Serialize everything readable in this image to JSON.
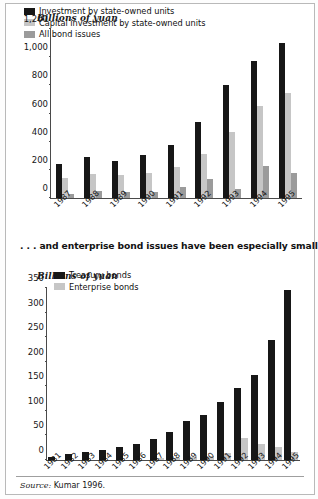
{
  "figure": {
    "mid_caption": ". . . and enterprise bond issues have been especially small",
    "source_prefix": "Source:",
    "source_text": " Kumar 1996."
  },
  "chart_data": [
    {
      "id": "top",
      "type": "bar",
      "title": "",
      "ylabel": "Billions of yuan",
      "xlabel": "",
      "ylim": [
        0,
        1200
      ],
      "yticks": [
        0,
        200,
        400,
        600,
        800,
        1000,
        1200
      ],
      "ytick_labels": [
        "0",
        "200",
        "400",
        "600",
        "800",
        "1,000",
        "1,200"
      ],
      "grid": false,
      "legend_position": "top-left",
      "categories": [
        "1987",
        "1988",
        "1989",
        "1990",
        "1991",
        "1992",
        "1993",
        "1994",
        "1995"
      ],
      "series": [
        {
          "name": "Investment by state-owned units",
          "color": "#171717",
          "values": [
            245,
            290,
            265,
            305,
            375,
            540,
            800,
            970,
            1100
          ]
        },
        {
          "name": "Capital investment by state-owned units",
          "color": "#c6c6c6",
          "values": [
            145,
            170,
            165,
            180,
            220,
            310,
            470,
            650,
            745
          ]
        },
        {
          "name": "All bond issues",
          "color": "#9b9b9b",
          "values": [
            25,
            48,
            42,
            40,
            75,
            135,
            65,
            225,
            178
          ]
        }
      ]
    },
    {
      "id": "bottom",
      "type": "bar",
      "title": "",
      "ylabel": "Billions of yuan",
      "xlabel": "",
      "ylim": [
        0,
        350
      ],
      "yticks": [
        0,
        50,
        100,
        150,
        200,
        250,
        300,
        350
      ],
      "ytick_labels": [
        "0",
        "50",
        "100",
        "150",
        "200",
        "250",
        "300",
        "350"
      ],
      "grid": false,
      "legend_position": "top-left",
      "categories": [
        "1981",
        "1982",
        "1983",
        "1984",
        "1985",
        "1986",
        "1987",
        "1988",
        "1989",
        "1990",
        "1991",
        "1992",
        "1993",
        "1994",
        "1995"
      ],
      "series": [
        {
          "name": "Treasury bonds",
          "color": "#171717",
          "values": [
            7,
            12,
            16,
            21,
            27,
            32,
            42,
            58,
            80,
            92,
            118,
            147,
            172,
            245,
            346
          ]
        },
        {
          "name": "Enterprise bonds",
          "color": "#c6c6c6",
          "values": [
            0,
            0,
            0,
            0,
            0,
            0,
            4,
            5,
            6,
            8,
            15,
            44,
            33,
            27,
            17
          ]
        }
      ]
    }
  ]
}
